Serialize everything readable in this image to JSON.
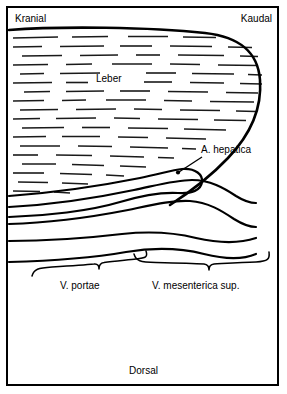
{
  "figure": {
    "type": "anatomical-line-diagram",
    "background_color": "#ffffff",
    "line_color": "#000000",
    "border_color": "#000000",
    "width": 287,
    "height": 394
  },
  "orientation": {
    "top_left": "Kranial",
    "top_right": "Kaudal",
    "bottom_center": "Dorsal"
  },
  "labels": {
    "liver": "Leber",
    "hepatic_artery": "A. hepatica",
    "portal_vein": "V. portae",
    "superior_mesenteric_vein": "V. mesenterica sup."
  },
  "structures": [
    {
      "name": "Leber",
      "kind": "organ",
      "fill_pattern": "horizontal-dashes",
      "label_position": "upper-left-center"
    },
    {
      "name": "A. hepatica",
      "kind": "artery",
      "has_leader_arrow": true,
      "label_position": "right-middle"
    },
    {
      "name": "V. portae",
      "kind": "vein",
      "has_brace": true,
      "label_position": "lower-left"
    },
    {
      "name": "V. mesenterica sup.",
      "kind": "vein",
      "has_brace": true,
      "label_position": "lower-right"
    }
  ]
}
